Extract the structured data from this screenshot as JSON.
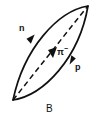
{
  "figure": {
    "caption": "B",
    "background_color": "#ffffff",
    "stroke_color": "#111111",
    "labels": {
      "neutron": "n",
      "pion": "π",
      "pion_charge": "−",
      "proton": "p"
    },
    "tracks": [
      {
        "name": "neutron-track",
        "particle_label": "n",
        "style": "solid",
        "direction": "downward-left",
        "description": "left curved arc of lens shape, arrow pointing down-left"
      },
      {
        "name": "pion-track",
        "particle_label": "π−",
        "style": "dashed",
        "direction": "upward-right",
        "description": "dashed diagonal chord from bottom-left vertex to top-right vertex, arrow pointing up-right"
      },
      {
        "name": "proton-track",
        "particle_label": "p",
        "style": "solid",
        "direction": "upward-right",
        "description": "right curved arc of lens shape, arrow pointing up-right"
      }
    ]
  }
}
